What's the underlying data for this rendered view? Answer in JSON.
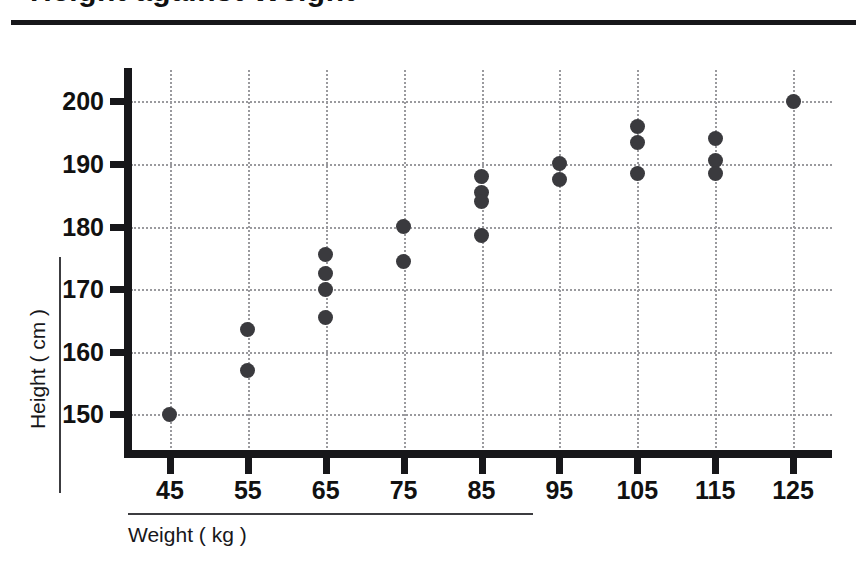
{
  "chart_data": {
    "type": "scatter",
    "title": "Height against Weight",
    "xlabel": "Weight ( kg )",
    "ylabel": "Height ( cm )",
    "xlim": [
      40,
      130
    ],
    "ylim": [
      144,
      205
    ],
    "xticks": [
      45,
      55,
      65,
      75,
      85,
      95,
      105,
      115,
      125
    ],
    "yticks": [
      150,
      160,
      170,
      180,
      190,
      200
    ],
    "grid": true,
    "legend": "none",
    "points": [
      {
        "x": 45,
        "y": 150.0
      },
      {
        "x": 55,
        "y": 163.5
      },
      {
        "x": 55,
        "y": 157.0
      },
      {
        "x": 65,
        "y": 175.5
      },
      {
        "x": 65,
        "y": 172.5
      },
      {
        "x": 65,
        "y": 170.0
      },
      {
        "x": 65,
        "y": 165.5
      },
      {
        "x": 75,
        "y": 180.0
      },
      {
        "x": 75,
        "y": 174.5
      },
      {
        "x": 85,
        "y": 188.0
      },
      {
        "x": 85,
        "y": 185.5
      },
      {
        "x": 85,
        "y": 184.0
      },
      {
        "x": 85,
        "y": 178.5
      },
      {
        "x": 95,
        "y": 190.0
      },
      {
        "x": 95,
        "y": 187.5
      },
      {
        "x": 105,
        "y": 196.0
      },
      {
        "x": 105,
        "y": 193.5
      },
      {
        "x": 105,
        "y": 188.5
      },
      {
        "x": 115,
        "y": 194.0
      },
      {
        "x": 115,
        "y": 190.5
      },
      {
        "x": 115,
        "y": 188.5
      },
      {
        "x": 125,
        "y": 200.0
      }
    ],
    "marker_color": "#3a3a3e",
    "grid_color": "#9a9a9e",
    "axis_color": "#17171a"
  }
}
